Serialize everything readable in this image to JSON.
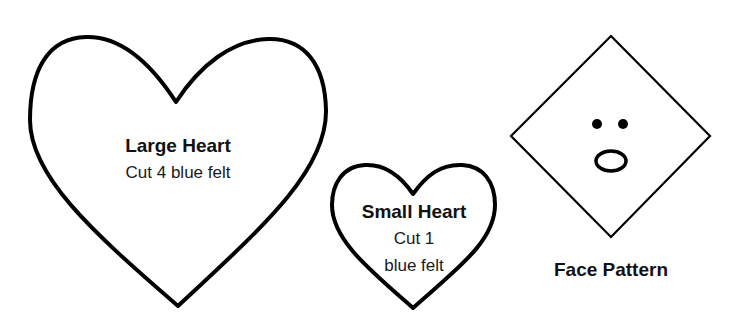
{
  "colors": {
    "stroke": "#000000",
    "background": "#ffffff",
    "text": "#111111"
  },
  "patterns": {
    "large_heart": {
      "title": "Large Heart",
      "instruction": "Cut 4 blue felt"
    },
    "small_heart": {
      "title": "Small Heart",
      "instruction_line1": "Cut 1",
      "instruction_line2": "blue felt"
    },
    "face": {
      "title": "Face Pattern"
    }
  }
}
